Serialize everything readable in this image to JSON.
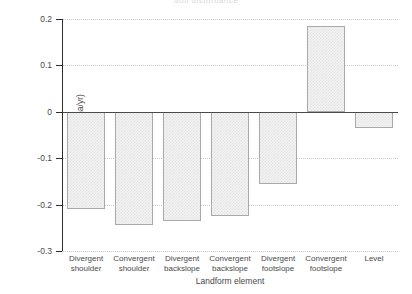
{
  "chart_data": {
    "type": "bar",
    "title": "Soil disturbance",
    "xlabel": "Landform element",
    "ylabel": "Soil gain or loss (t/ha/yr)",
    "categories": [
      "Divergent shoulder",
      "Convergent shoulder",
      "Divergent backslope",
      "Convergent backslope",
      "Divergent footslope",
      "Convergent footslope",
      "Level"
    ],
    "category_lines": [
      [
        "Divergent",
        "shoulder"
      ],
      [
        "Convergent",
        "shoulder"
      ],
      [
        "Divergent",
        "backslope"
      ],
      [
        "Convergent",
        "backslope"
      ],
      [
        "Divergent",
        "footslope"
      ],
      [
        "Convergent",
        "footslope"
      ],
      [
        "Level",
        ""
      ]
    ],
    "values": [
      -0.21,
      -0.245,
      -0.235,
      -0.225,
      -0.155,
      0.185,
      -0.035
    ],
    "ylim": [
      -0.3,
      0.2
    ],
    "yticks": [
      0.2,
      0.1,
      0,
      -0.1,
      -0.2,
      -0.3
    ],
    "ytick_labels": [
      "0.2",
      "0.1",
      "0",
      "-0.1",
      "-0.2",
      "-0.3"
    ],
    "grid": true,
    "grid_style": "dotted",
    "legend": "none",
    "bar_fill": "#f2f2f2",
    "bar_edge": "#a9a9a9",
    "axis_color": "#2b2b2b",
    "grid_color": "#c9c9c9"
  }
}
